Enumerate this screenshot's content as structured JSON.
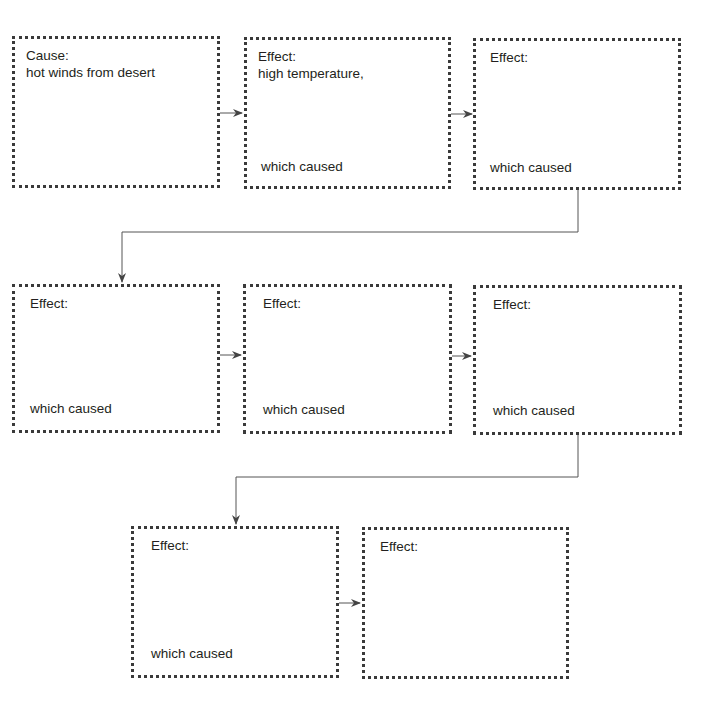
{
  "diagram": {
    "type": "cause-effect chain",
    "colors": {
      "border": "#3a3a3a",
      "line": "#555555",
      "text": "#231f20",
      "background": "#ffffff"
    },
    "boxes": [
      {
        "id": "b1",
        "label": "Cause:",
        "content": "hot winds from desert",
        "footer": ""
      },
      {
        "id": "b2",
        "label": "Effect:",
        "content": "high temperature,",
        "footer": "which caused"
      },
      {
        "id": "b3",
        "label": "Effect:",
        "content": "",
        "footer": "which caused"
      },
      {
        "id": "b4",
        "label": "Effect:",
        "content": "",
        "footer": "which caused"
      },
      {
        "id": "b5",
        "label": "Effect:",
        "content": "",
        "footer": "which caused"
      },
      {
        "id": "b6",
        "label": "Effect:",
        "content": "",
        "footer": "which caused"
      },
      {
        "id": "b7",
        "label": "Effect:",
        "content": "",
        "footer": "which caused"
      },
      {
        "id": "b8",
        "label": "Effect:",
        "content": "",
        "footer": ""
      }
    ],
    "connections": [
      [
        "b1",
        "b2"
      ],
      [
        "b2",
        "b3"
      ],
      [
        "b3",
        "b4"
      ],
      [
        "b4",
        "b5"
      ],
      [
        "b5",
        "b6"
      ],
      [
        "b6",
        "b7"
      ],
      [
        "b7",
        "b8"
      ]
    ]
  }
}
